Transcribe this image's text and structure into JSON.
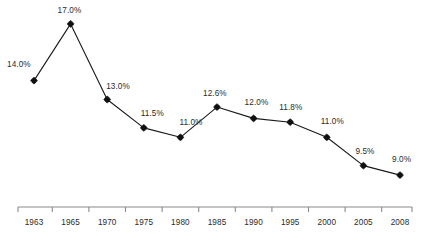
{
  "chart_data": {
    "type": "line",
    "title": "",
    "subtitle": "",
    "xlabel": "",
    "ylabel": "",
    "categories": [
      "1963",
      "1965",
      "1970",
      "1975",
      "1980",
      "1985",
      "1990",
      "1995",
      "2000",
      "2005",
      "2008"
    ],
    "values": [
      14.0,
      17.0,
      13.0,
      11.5,
      11.0,
      12.6,
      12.0,
      11.8,
      11.0,
      9.5,
      9.0
    ],
    "data_labels": [
      "14.0%",
      "17.0%",
      "13.0%",
      "11.5%",
      "11.0%",
      "12.6%",
      "12.0%",
      "11.8%",
      "11.0%",
      "9.5%",
      "9.0%"
    ],
    "ylim": [
      8.0,
      18.0
    ],
    "grid": false,
    "legend": false,
    "legend_position": "none",
    "y_axis_visible": false,
    "x_axis_visible": true,
    "marker": "diamond",
    "series_color": "#111111",
    "axis_color": "#8a8a8a",
    "label_color": "#2b2b2b",
    "background_color": "#ffffff"
  }
}
